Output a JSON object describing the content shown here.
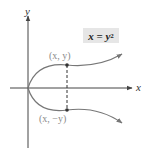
{
  "diagram": {
    "axes": {
      "x_label": "x",
      "y_label": "y"
    },
    "equation": {
      "lhs": "x",
      "equals": " = ",
      "rhs_base": "y",
      "rhs_exp": "2",
      "box_color": "#e6e6e6"
    },
    "points": [
      {
        "label": "(x, y)",
        "position": "upper"
      },
      {
        "label": "(x, −y)",
        "position": "lower"
      }
    ],
    "colors": {
      "curve": "#555555",
      "axes": "#333333",
      "label": "#8a8a8a"
    }
  }
}
